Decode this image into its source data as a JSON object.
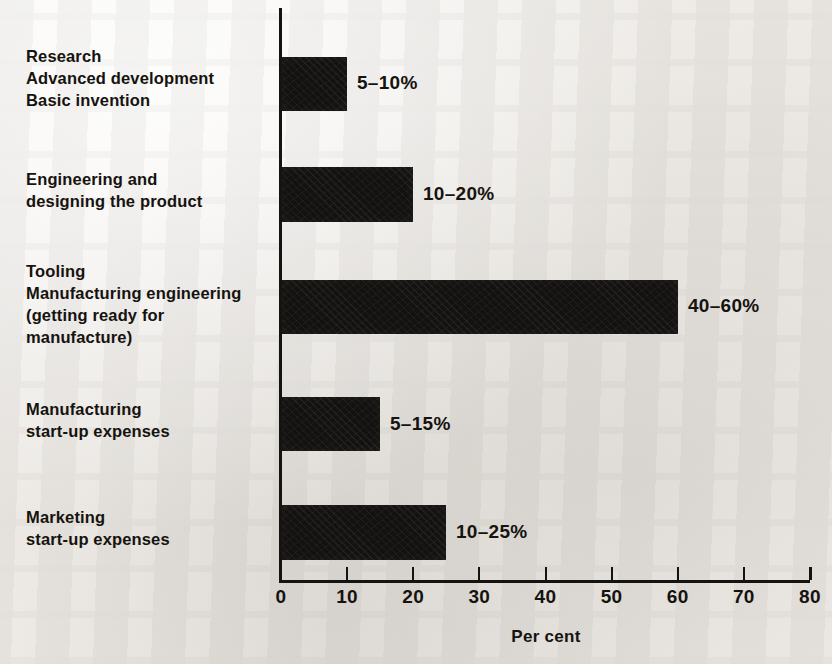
{
  "chart_data": {
    "type": "bar",
    "orientation": "horizontal",
    "title": "",
    "xlabel": "Per cent",
    "ylabel": "",
    "xlim": [
      0,
      80
    ],
    "xticks": [
      0,
      10,
      20,
      30,
      40,
      50,
      60,
      70,
      80
    ],
    "xtick_labels": [
      "0",
      "10",
      "20",
      "30",
      "40",
      "50",
      "60",
      "70",
      "80"
    ],
    "grid": false,
    "legend": false,
    "bar_color": "#141210",
    "background_color": "#f3f1ee",
    "categories": [
      "Research\nAdvanced development\nBasic invention",
      "Engineering and\ndesigning the product",
      "Tooling\nManufacturing engineering\n(getting ready for\nmanufacture)",
      "Manufacturing\nstart-up expenses",
      "Marketing\nstart-up expenses"
    ],
    "values": [
      10,
      20,
      60,
      15,
      25
    ],
    "range_low": [
      5,
      10,
      40,
      5,
      10
    ],
    "range_high": [
      10,
      20,
      60,
      15,
      25
    ],
    "data_labels": [
      "5–10%",
      "10–20%",
      "40–60%",
      "5–15%",
      "10–25%"
    ],
    "bars": [
      {
        "label": "Research\nAdvanced development\nBasic invention",
        "value": 10,
        "low": 5,
        "high": 10,
        "data_label": "5–10%",
        "top": 57,
        "height": 54,
        "label_top": 46,
        "value_top": 72,
        "value_left": 357
      },
      {
        "label": "Engineering and\ndesigning the product",
        "value": 20,
        "low": 10,
        "high": 20,
        "data_label": "10–20%",
        "top": 167,
        "height": 55,
        "label_top": 169,
        "value_top": 183,
        "value_left": 423
      },
      {
        "label": "Tooling\nManufacturing engineering\n(getting ready for\nmanufacture)",
        "value": 60,
        "low": 40,
        "high": 60,
        "data_label": "40–60%",
        "top": 280,
        "height": 54,
        "label_top": 261,
        "value_top": 295,
        "value_left": 688
      },
      {
        "label": "Manufacturing\nstart-up expenses",
        "value": 15,
        "low": 5,
        "high": 15,
        "data_label": "5–15%",
        "top": 397,
        "height": 54,
        "label_top": 399,
        "value_top": 413,
        "value_left": 390
      },
      {
        "label": "Marketing\nstart-up expenses",
        "value": 25,
        "low": 10,
        "high": 25,
        "data_label": "10–25%",
        "top": 505,
        "height": 55,
        "label_top": 507,
        "value_top": 521,
        "value_left": 456
      }
    ]
  }
}
